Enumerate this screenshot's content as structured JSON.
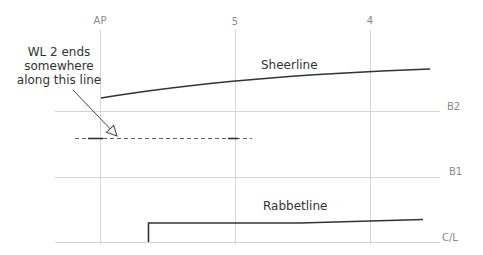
{
  "stations": [
    {
      "label": "AP",
      "x": 100
    },
    {
      "label": "5",
      "x": 235
    },
    {
      "label": "4",
      "x": 370
    }
  ],
  "buttocks": [
    {
      "label": "B2",
      "y": 111
    },
    {
      "label": "B1",
      "y": 177
    },
    {
      "label": "C/L",
      "y": 242
    }
  ],
  "curves": {
    "sheerline": {
      "label": "Sheerline"
    },
    "rabbetline": {
      "label": "Rabbetline"
    }
  },
  "annotation": {
    "line1": "WL 2 ends",
    "line2": "somewhere",
    "line3": "along this line"
  },
  "colors": {
    "grid": "#d4d4d4",
    "curve": "#333333",
    "label": "#8a8a8a"
  }
}
